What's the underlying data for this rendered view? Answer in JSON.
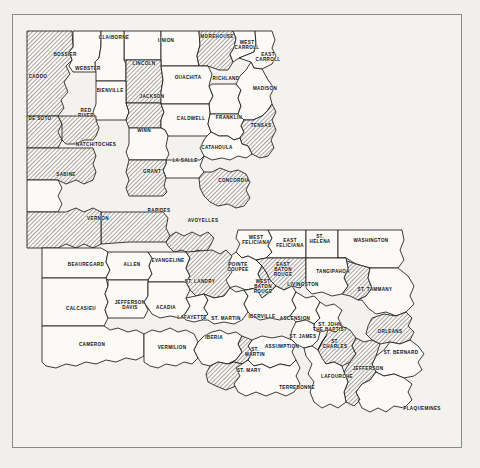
{
  "map": {
    "title": "Louisiana Parish Map",
    "region": "Louisiana",
    "subdivision_type": "Parish",
    "parish_count": 64,
    "legend": {
      "hatched_label": "hatched",
      "plain_label": "plain"
    },
    "colors": {
      "page_background": "#f0efeb",
      "map_background": "#f3f2ee",
      "frame_border": "#8a8a8a",
      "outline": "#1a1a1a",
      "hatch_line": "#3c3c3c",
      "parish_white": "#fbfaf7",
      "label_text": "#101010"
    },
    "frame": {
      "x": 12,
      "y": 14,
      "width": 450,
      "height": 434
    }
  },
  "parishes": [
    {
      "name": "BOSSIER",
      "label": "BOSSIER",
      "x": 65,
      "y": 55,
      "fill": "white"
    },
    {
      "name": "CADDO",
      "label": "CADDO",
      "x": 38,
      "y": 77,
      "fill": "hatch"
    },
    {
      "name": "CLAIBORNE",
      "label": "CLAIBORNE",
      "x": 114,
      "y": 38,
      "fill": "white"
    },
    {
      "name": "UNION",
      "label": "UNION",
      "x": 166,
      "y": 41,
      "fill": "white"
    },
    {
      "name": "MOREHOUSE",
      "label": "MOREHOUSE",
      "x": 217,
      "y": 37,
      "fill": "hatch"
    },
    {
      "name": "WEST CARROLL",
      "label": "WEST\nCARROLL",
      "x": 247,
      "y": 45,
      "fill": "white"
    },
    {
      "name": "EAST CARROLL",
      "label": "EAST\nCARROLL",
      "x": 268,
      "y": 57,
      "fill": "white"
    },
    {
      "name": "WEBSTER",
      "label": "WEBSTER",
      "x": 88,
      "y": 69,
      "fill": "white"
    },
    {
      "name": "LINCOLN",
      "label": "LINCOLN",
      "x": 144,
      "y": 64,
      "fill": "hatch"
    },
    {
      "name": "OUACHITA",
      "label": "OUACHITA",
      "x": 188,
      "y": 78,
      "fill": "white"
    },
    {
      "name": "RICHLAND",
      "label": "RICHLAND",
      "x": 226,
      "y": 79,
      "fill": "white"
    },
    {
      "name": "MADISON",
      "label": "MADISON",
      "x": 265,
      "y": 89,
      "fill": "white"
    },
    {
      "name": "BIENVILLE",
      "label": "BIENVILLE",
      "x": 110,
      "y": 91,
      "fill": "white"
    },
    {
      "name": "JACKSON",
      "label": "JACKSON",
      "x": 152,
      "y": 97,
      "fill": "hatch"
    },
    {
      "name": "CALDWELL",
      "label": "CALDWELL",
      "x": 191,
      "y": 119,
      "fill": "white"
    },
    {
      "name": "FRANKLIN",
      "label": "FRANKLIN",
      "x": 229,
      "y": 118,
      "fill": "white"
    },
    {
      "name": "TENSAS",
      "label": "TENSAS",
      "x": 261,
      "y": 126,
      "fill": "hatch"
    },
    {
      "name": "DE SOTO",
      "label": "DE SOTO",
      "x": 40,
      "y": 119,
      "fill": "hatch"
    },
    {
      "name": "RED RIVER",
      "label": "RED\nRIVER",
      "x": 86,
      "y": 113,
      "fill": "hatch"
    },
    {
      "name": "WINN",
      "label": "WINN",
      "x": 144,
      "y": 131,
      "fill": "white"
    },
    {
      "name": "CATAHOULA",
      "label": "CATAHOULA",
      "x": 217,
      "y": 148,
      "fill": "white"
    },
    {
      "name": "NATCHITOCHES",
      "label": "NATCHITOCHES",
      "x": 96,
      "y": 145,
      "fill": "hatch"
    },
    {
      "name": "LA SALLE",
      "label": "LA SALLE",
      "x": 185,
      "y": 161,
      "fill": "white"
    },
    {
      "name": "GRANT",
      "label": "GRANT",
      "x": 152,
      "y": 172,
      "fill": "hatch"
    },
    {
      "name": "SABINE",
      "label": "SABINE",
      "x": 66,
      "y": 175,
      "fill": "white"
    },
    {
      "name": "CONCORDIA",
      "label": "CONCORDIA",
      "x": 234,
      "y": 181,
      "fill": "hatch"
    },
    {
      "name": "RAPIDES",
      "label": "RAPIDES",
      "x": 159,
      "y": 211,
      "fill": "hatch"
    },
    {
      "name": "AVOYELLES",
      "label": "AVOYELLES",
      "x": 203,
      "y": 221,
      "fill": "hatch"
    },
    {
      "name": "VERNON",
      "label": "VERNON",
      "x": 98,
      "y": 219,
      "fill": "hatch"
    },
    {
      "name": "WEST FELICIANA",
      "label": "WEST\nFELICIANA",
      "x": 256,
      "y": 240,
      "fill": "white"
    },
    {
      "name": "EAST FELICIANA",
      "label": "EAST\nFELICIANA",
      "x": 290,
      "y": 243,
      "fill": "white"
    },
    {
      "name": "ST. HELENA",
      "label": "ST.\nHELENA",
      "x": 320,
      "y": 239,
      "fill": "white"
    },
    {
      "name": "WASHINGTON",
      "label": "WASHINGTON",
      "x": 371,
      "y": 241,
      "fill": "white"
    },
    {
      "name": "BEAUREGARD",
      "label": "BEAUREGARD",
      "x": 86,
      "y": 265,
      "fill": "white"
    },
    {
      "name": "ALLEN",
      "label": "ALLEN",
      "x": 132,
      "y": 265,
      "fill": "white"
    },
    {
      "name": "EVANGELINE",
      "label": "EVANGELINE",
      "x": 168,
      "y": 261,
      "fill": "white"
    },
    {
      "name": "POINTE COUPEE",
      "label": "POINTE\nCOUPEE",
      "x": 238,
      "y": 267,
      "fill": "white"
    },
    {
      "name": "EAST BATON ROUGE",
      "label": "EAST\nBATON\nROUGE",
      "x": 283,
      "y": 270,
      "fill": "hatch"
    },
    {
      "name": "TANGIPAHOA",
      "label": "TANGIPAHOA",
      "x": 333,
      "y": 272,
      "fill": "hatch"
    },
    {
      "name": "LIVINGSTON",
      "label": "LIVINGSTON",
      "x": 303,
      "y": 285,
      "fill": "white"
    },
    {
      "name": "ST. TAMMANY",
      "label": "ST. TAMMANY",
      "x": 375,
      "y": 290,
      "fill": "white"
    },
    {
      "name": "WEST BATON ROUGE",
      "label": "WEST\nBATON\nROUGE",
      "x": 263,
      "y": 287,
      "fill": "hatch"
    },
    {
      "name": "ST. LANDRY",
      "label": "ST. LANDRY",
      "x": 200,
      "y": 282,
      "fill": "hatch"
    },
    {
      "name": "CALCASIEU",
      "label": "CALCASIEU",
      "x": 81,
      "y": 309,
      "fill": "white"
    },
    {
      "name": "JEFFERSON DAVIS",
      "label": "JEFFERSON\nDAVIS",
      "x": 130,
      "y": 305,
      "fill": "white"
    },
    {
      "name": "ACADIA",
      "label": "ACADIA",
      "x": 166,
      "y": 308,
      "fill": "white"
    },
    {
      "name": "LAFAYETTE",
      "label": "LAFAYETTE",
      "x": 192,
      "y": 318,
      "fill": "white"
    },
    {
      "name": "ST. MARTIN",
      "label": "ST. MARTIN",
      "x": 226,
      "y": 319,
      "fill": "white"
    },
    {
      "name": "IBERVILLE",
      "label": "IBERVILLE",
      "x": 262,
      "y": 317,
      "fill": "white"
    },
    {
      "name": "ASCENSION",
      "label": "ASCENSION",
      "x": 295,
      "y": 319,
      "fill": "white"
    },
    {
      "name": "ST. JOHN THE BAPTIST",
      "label": "ST. JOHN\nTHE BAPTIST",
      "x": 330,
      "y": 327,
      "fill": "white"
    },
    {
      "name": "ORLEANS",
      "label": "ORLEANS",
      "x": 390,
      "y": 332,
      "fill": "hatch"
    },
    {
      "name": "CAMERON",
      "label": "CAMERON",
      "x": 92,
      "y": 345,
      "fill": "white"
    },
    {
      "name": "VERMILION",
      "label": "VERMILION",
      "x": 172,
      "y": 348,
      "fill": "white"
    },
    {
      "name": "IBERIA",
      "label": "IBERIA",
      "x": 214,
      "y": 338,
      "fill": "white"
    },
    {
      "name": "ST. JAMES",
      "label": "ST. JAMES",
      "x": 303,
      "y": 337,
      "fill": "white"
    },
    {
      "name": "ST. CHARLES",
      "label": "ST.\nCHARLES",
      "x": 335,
      "y": 344,
      "fill": "hatch"
    },
    {
      "name": "ST. BERNARD",
      "label": "ST. BERNARD",
      "x": 401,
      "y": 353,
      "fill": "white"
    },
    {
      "name": "ASSUMPTION",
      "label": "ASSUMPTION",
      "x": 282,
      "y": 347,
      "fill": "white"
    },
    {
      "name": "ST. MARTIN (SOUTH)",
      "label": "ST.\nMARTIN",
      "x": 255,
      "y": 352,
      "fill": "hatch"
    },
    {
      "name": "ST. MARY",
      "label": "ST. MARY",
      "x": 249,
      "y": 371,
      "fill": "hatch"
    },
    {
      "name": "JEFFERSON",
      "label": "JEFFERSON",
      "x": 368,
      "y": 369,
      "fill": "hatch"
    },
    {
      "name": "LAFOURCHE",
      "label": "LAFOURCHE",
      "x": 337,
      "y": 377,
      "fill": "white"
    },
    {
      "name": "TERREBONNE",
      "label": "TERREBONNE",
      "x": 297,
      "y": 388,
      "fill": "white"
    },
    {
      "name": "PLAQUEMINES",
      "label": "PLAQUEMINES",
      "x": 422,
      "y": 409,
      "fill": "white"
    }
  ]
}
